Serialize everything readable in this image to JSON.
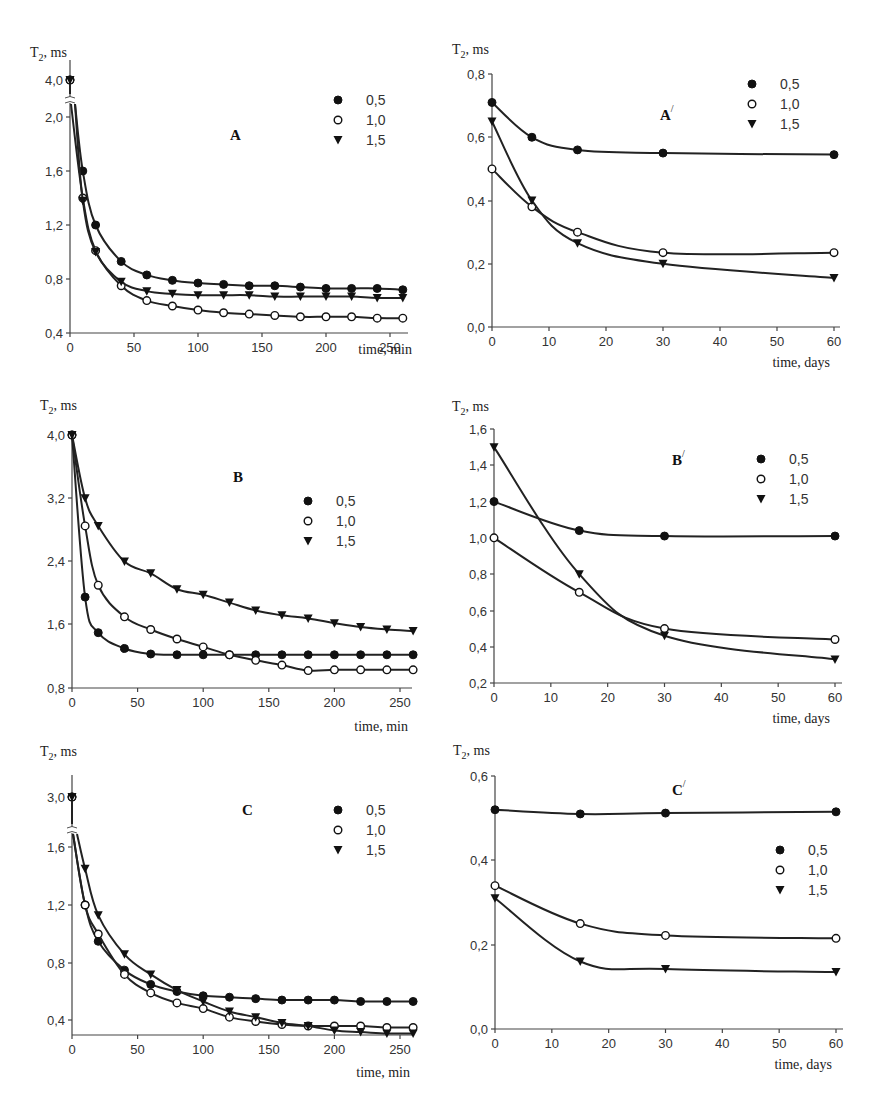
{
  "chart_data": [
    {
      "id": "A",
      "type": "line",
      "title": "A",
      "xlabel": "time, min",
      "ylabel": "T2, ms",
      "xlim": [
        0,
        260
      ],
      "xticks": [
        0,
        50,
        100,
        150,
        200,
        250
      ],
      "yticks": [
        "0,4",
        "0,8",
        "1,2",
        "1,6",
        "2,0",
        "4,0"
      ],
      "y_axis_break": true,
      "legend": [
        "0,5",
        "1,0",
        "1,5"
      ],
      "x": [
        0,
        10,
        20,
        40,
        60,
        80,
        100,
        120,
        140,
        160,
        180,
        200,
        220,
        240,
        260
      ],
      "series": [
        {
          "name": "0,5",
          "marker": "filled-circle",
          "values": [
            4.0,
            1.6,
            1.2,
            0.93,
            0.83,
            0.79,
            0.77,
            0.76,
            0.75,
            0.75,
            0.74,
            0.73,
            0.73,
            0.73,
            0.72
          ]
        },
        {
          "name": "1,0",
          "marker": "open-circle",
          "values": [
            4.0,
            1.4,
            1.01,
            0.75,
            0.64,
            0.6,
            0.57,
            0.55,
            0.54,
            0.53,
            0.52,
            0.52,
            0.52,
            0.51,
            0.51
          ]
        },
        {
          "name": "1,5",
          "marker": "filled-triangle-down",
          "values": [
            4.0,
            1.38,
            1.0,
            0.78,
            0.71,
            0.69,
            0.68,
            0.68,
            0.68,
            0.67,
            0.67,
            0.67,
            0.67,
            0.66,
            0.66
          ]
        }
      ]
    },
    {
      "id": "A_prime",
      "type": "line",
      "title": "A'",
      "xlabel": "time, days",
      "ylabel": "T2, ms",
      "xlim": [
        0,
        60
      ],
      "ylim": [
        0.0,
        0.8
      ],
      "xticks": [
        0,
        10,
        20,
        30,
        40,
        50,
        60
      ],
      "yticks": [
        "0,0",
        "0,2",
        "0,4",
        "0,6",
        "0,8"
      ],
      "legend": [
        "0,5",
        "1,0",
        "1,5"
      ],
      "x": [
        0,
        7,
        15,
        30,
        60
      ],
      "series": [
        {
          "name": "0,5",
          "marker": "filled-circle",
          "values": [
            0.71,
            0.6,
            0.56,
            0.55,
            0.545
          ]
        },
        {
          "name": "1,0",
          "marker": "open-circle",
          "values": [
            0.5,
            0.38,
            0.3,
            0.235,
            0.235
          ]
        },
        {
          "name": "1,5",
          "marker": "filled-triangle-down",
          "values": [
            0.65,
            0.4,
            0.265,
            0.2,
            0.155
          ]
        }
      ]
    },
    {
      "id": "B",
      "type": "line",
      "title": "B",
      "xlabel": "time, min",
      "ylabel": "T2, ms",
      "xlim": [
        0,
        260
      ],
      "ylim": [
        0.8,
        4.0
      ],
      "xticks": [
        0,
        50,
        100,
        150,
        200,
        250
      ],
      "yticks": [
        "0,8",
        "1,6",
        "2,4",
        "3,2",
        "4,0"
      ],
      "legend": [
        "0,5",
        "1,0",
        "1,5"
      ],
      "x": [
        0,
        10,
        20,
        40,
        60,
        80,
        100,
        120,
        140,
        160,
        180,
        200,
        220,
        240,
        260
      ],
      "series": [
        {
          "name": "0,5",
          "marker": "filled-circle",
          "values": [
            4.0,
            1.95,
            1.5,
            1.3,
            1.23,
            1.22,
            1.22,
            1.22,
            1.22,
            1.22,
            1.22,
            1.22,
            1.22,
            1.22,
            1.22
          ]
        },
        {
          "name": "1,0",
          "marker": "open-circle",
          "values": [
            4.0,
            2.85,
            2.1,
            1.7,
            1.54,
            1.42,
            1.32,
            1.22,
            1.15,
            1.09,
            1.02,
            1.03,
            1.03,
            1.03,
            1.03
          ]
        },
        {
          "name": "1,5",
          "marker": "filled-triangle-down",
          "values": [
            4.0,
            3.2,
            2.85,
            2.4,
            2.25,
            2.05,
            1.98,
            1.88,
            1.78,
            1.72,
            1.68,
            1.62,
            1.57,
            1.54,
            1.52
          ]
        }
      ]
    },
    {
      "id": "B_prime",
      "type": "line",
      "title": "B'",
      "xlabel": "time, days",
      "ylabel": "T2, ms",
      "xlim": [
        0,
        60
      ],
      "ylim": [
        0.2,
        1.6
      ],
      "xticks": [
        0,
        10,
        20,
        30,
        40,
        50,
        60
      ],
      "yticks": [
        "0,2",
        "0,4",
        "0,6",
        "0,8",
        "1,0",
        "1,2",
        "1,4",
        "1,6"
      ],
      "legend": [
        "0,5",
        "1,0",
        "1,5"
      ],
      "x": [
        0,
        15,
        30,
        60
      ],
      "series": [
        {
          "name": "0,5",
          "marker": "filled-circle",
          "values": [
            1.2,
            1.04,
            1.01,
            1.01
          ]
        },
        {
          "name": "1,0",
          "marker": "open-circle",
          "values": [
            1.0,
            0.7,
            0.5,
            0.44
          ]
        },
        {
          "name": "1,5",
          "marker": "filled-triangle-down",
          "values": [
            1.5,
            0.8,
            0.46,
            0.33
          ]
        }
      ]
    },
    {
      "id": "C",
      "type": "line",
      "title": "C",
      "xlabel": "time, min",
      "ylabel": "T2, ms",
      "xlim": [
        0,
        260
      ],
      "xticks": [
        0,
        50,
        100,
        150,
        200,
        250
      ],
      "yticks": [
        "0,4",
        "0,8",
        "1,2",
        "1,6",
        "3,0"
      ],
      "y_axis_break": true,
      "legend": [
        "0,5",
        "1,0",
        "1,5"
      ],
      "x": [
        0,
        10,
        20,
        40,
        60,
        80,
        100,
        120,
        140,
        160,
        180,
        200,
        220,
        240,
        260
      ],
      "series": [
        {
          "name": "0,5",
          "marker": "filled-circle",
          "values": [
            3.0,
            1.2,
            0.95,
            0.75,
            0.65,
            0.6,
            0.57,
            0.56,
            0.55,
            0.54,
            0.54,
            0.54,
            0.53,
            0.53,
            0.53
          ]
        },
        {
          "name": "1,0",
          "marker": "open-circle",
          "values": [
            3.0,
            1.2,
            1.0,
            0.72,
            0.59,
            0.52,
            0.48,
            0.42,
            0.39,
            0.37,
            0.36,
            0.36,
            0.36,
            0.35,
            0.35
          ]
        },
        {
          "name": "1,5",
          "marker": "filled-triangle-down",
          "values": [
            3.0,
            1.45,
            1.13,
            0.86,
            0.72,
            0.61,
            0.53,
            0.46,
            0.42,
            0.38,
            0.36,
            0.33,
            0.32,
            0.31,
            0.31
          ]
        }
      ]
    },
    {
      "id": "C_prime",
      "type": "line",
      "title": "C'",
      "xlabel": "time, days",
      "ylabel": "T2, ms",
      "xlim": [
        0,
        60
      ],
      "ylim": [
        0.0,
        0.6
      ],
      "xticks": [
        0,
        10,
        20,
        30,
        40,
        50,
        60
      ],
      "yticks": [
        "0,0",
        "0,2",
        "0,4",
        "0,6"
      ],
      "legend": [
        "0,5",
        "1,0",
        "1,5"
      ],
      "x": [
        0,
        15,
        30,
        60
      ],
      "series": [
        {
          "name": "0,5",
          "marker": "filled-circle",
          "values": [
            0.52,
            0.51,
            0.512,
            0.515
          ]
        },
        {
          "name": "1,0",
          "marker": "open-circle",
          "values": [
            0.34,
            0.25,
            0.222,
            0.215
          ]
        },
        {
          "name": "1,5",
          "marker": "filled-triangle-down",
          "values": [
            0.31,
            0.16,
            0.142,
            0.135
          ]
        }
      ]
    }
  ],
  "layout": {
    "panels": [
      {
        "id": "A",
        "x0": 70,
        "x1": 390,
        "xv1": 250,
        "axisY": 333,
        "axisTopY": 70,
        "yTop": 80,
        "ymap": [
          [
            0.4,
            333
          ],
          [
            0.8,
            279
          ],
          [
            1.2,
            225
          ],
          [
            1.6,
            171
          ],
          [
            2.0,
            117
          ],
          [
            4.0,
            80
          ]
        ],
        "breakAt": 2.1,
        "breakY": 100,
        "tickY": [
          [
            "0,4",
            333
          ],
          [
            "0,8",
            279
          ],
          [
            "1,2",
            225
          ],
          [
            "1,6",
            171
          ],
          [
            "2,0",
            117
          ],
          [
            "4,0",
            80
          ]
        ],
        "xAxisEnd": 408,
        "label": [
          230,
          140
        ],
        "legend": [
          338,
          104
        ],
        "ylabelPos": [
          30,
          57
        ],
        "xlabelPos": [
          412,
          354
        ]
      },
      {
        "id": "A_prime",
        "x0": 492,
        "x1": 834,
        "xv1": 60,
        "axisY": 327,
        "axisTopY": 74,
        "ymap": [
          [
            0.0,
            327
          ],
          [
            0.8,
            74
          ]
        ],
        "tickY": [
          [
            "0,0",
            327
          ],
          [
            "0,2",
            264
          ],
          [
            "0,4",
            201
          ],
          [
            "0,6",
            137
          ],
          [
            "0,8",
            74
          ]
        ],
        "xAxisEnd": 840,
        "label": [
          660,
          120
        ],
        "legend": [
          752,
          88
        ],
        "ylabelPos": [
          452,
          54
        ],
        "xlabelPos": [
          830,
          367
        ]
      },
      {
        "id": "B",
        "x0": 72,
        "x1": 400,
        "xv1": 250,
        "axisY": 688,
        "axisTopY": 435,
        "ymap": [
          [
            0.8,
            688
          ],
          [
            4.0,
            435
          ]
        ],
        "tickY": [
          [
            "0,8",
            688
          ],
          [
            "1,6",
            624
          ],
          [
            "2,4",
            561
          ],
          [
            "3,2",
            498
          ],
          [
            "4,0",
            435
          ]
        ],
        "xAxisEnd": 412,
        "label": [
          233,
          482
        ],
        "legend": [
          308,
          505
        ],
        "ylabelPos": [
          40,
          410
        ],
        "xlabelPos": [
          408,
          731
        ]
      },
      {
        "id": "B_prime",
        "x0": 494,
        "x1": 835,
        "xv1": 60,
        "axisY": 683,
        "axisTopY": 429,
        "ymap": [
          [
            0.2,
            683
          ],
          [
            1.6,
            429
          ]
        ],
        "tickY": [
          [
            "0,2",
            683
          ],
          [
            "0,4",
            647
          ],
          [
            "0,6",
            611
          ],
          [
            "0,8",
            574
          ],
          [
            "1,0",
            538
          ],
          [
            "1,2",
            502
          ],
          [
            "1,4",
            465
          ],
          [
            "1,6",
            429
          ]
        ],
        "xAxisEnd": 842,
        "label": [
          672,
          465
        ],
        "legend": [
          761,
          463
        ],
        "ylabelPos": [
          452,
          411
        ],
        "xlabelPos": [
          830,
          723
        ]
      },
      {
        "id": "C",
        "x0": 72,
        "x1": 400,
        "xv1": 250,
        "axisY": 1035,
        "axisTopY": 785,
        "ymap": [
          [
            0.3,
            1035
          ],
          [
            0.4,
            1020
          ],
          [
            0.8,
            963
          ],
          [
            1.2,
            905
          ],
          [
            1.6,
            847
          ],
          [
            1.7,
            833
          ],
          [
            3.0,
            797
          ]
        ],
        "breakAt": 1.75,
        "breakY": 830,
        "tickY": [
          [
            "0,4",
            1020
          ],
          [
            "0,8",
            963
          ],
          [
            "1,2",
            905
          ],
          [
            "1,6",
            847
          ],
          [
            "3,0",
            797
          ]
        ],
        "xAxisEnd": 412,
        "label": [
          242,
          815
        ],
        "legend": [
          338,
          814
        ],
        "ylabelPos": [
          40,
          756
        ],
        "xlabelPos": [
          410,
          1077
        ]
      },
      {
        "id": "C_prime",
        "x0": 495,
        "x1": 836,
        "xv1": 60,
        "axisY": 1029,
        "axisTopY": 776,
        "ymap": [
          [
            0.0,
            1029
          ],
          [
            0.6,
            776
          ]
        ],
        "tickY": [
          [
            "0,0",
            1029
          ],
          [
            "0,2",
            945
          ],
          [
            "0,4",
            860
          ],
          [
            "0,6",
            776
          ]
        ],
        "xAxisEnd": 843,
        "label": [
          672,
          795
        ],
        "legend": [
          780,
          854
        ],
        "ylabelPos": [
          453,
          755
        ],
        "xlabelPos": [
          832,
          1069
        ]
      }
    ]
  }
}
